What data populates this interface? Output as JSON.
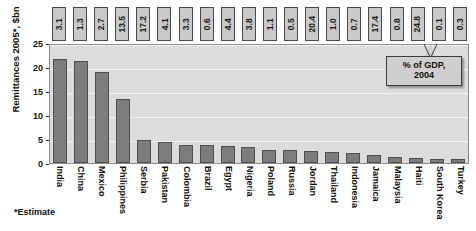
{
  "chart_data": {
    "type": "bar",
    "title": "",
    "xlabel": "",
    "ylabel": "Remittances 2005*, $bn",
    "ylim": [
      0,
      25
    ],
    "yticks": [
      "0",
      "5",
      "10",
      "15",
      "20",
      "25"
    ],
    "grid": true,
    "legend": "none",
    "categories": [
      "India",
      "China",
      "Mexico",
      "Philippines",
      "Serbia",
      "Pakistan",
      "Colombia",
      "Brazil",
      "Egypt",
      "Nigeria",
      "Poland",
      "Russia",
      "Jordan",
      "Thailand",
      "Indonesia",
      "Jamaica",
      "Malaysia",
      "Haiti",
      "South Korea",
      "Turkey"
    ],
    "series": [
      {
        "name": "Remittances 2005*, $bn",
        "values": [
          21.7,
          21.3,
          19.0,
          13.4,
          4.8,
          4.3,
          3.8,
          3.7,
          3.5,
          3.4,
          2.8,
          2.8,
          2.5,
          2.2,
          2.0,
          1.6,
          1.2,
          1.1,
          0.9,
          0.9
        ]
      },
      {
        "name": "% of GDP, 2004",
        "values": [
          "3.1",
          "1.3",
          "2.7",
          "13.5",
          "17.2",
          "4.1",
          "3.3",
          "0.6",
          "4.4",
          "3.8",
          "1.1",
          "0.5",
          "20.4",
          "1.0",
          "0.7",
          "17.4",
          "0.8",
          "24.8",
          "0.1",
          "0.3"
        ]
      }
    ],
    "annotations": [
      {
        "text": "% of GDP, 2004",
        "target": "top-value-boxes"
      },
      {
        "text": "*Estimate",
        "target": "footnote"
      }
    ],
    "colors": {
      "bar_fill": "#7d7d7d",
      "bar_edge": "#4f4f4f",
      "plot_background": "#dcdcdc",
      "gridline": "#f2f2f2",
      "box_fill": "#c9c9c9",
      "callout_fill": "#cfcfcf",
      "text": "#111111"
    }
  },
  "callout": {
    "line1": "% of GDP,",
    "line2": "2004"
  },
  "footnote": {
    "text": "*Estimate"
  }
}
